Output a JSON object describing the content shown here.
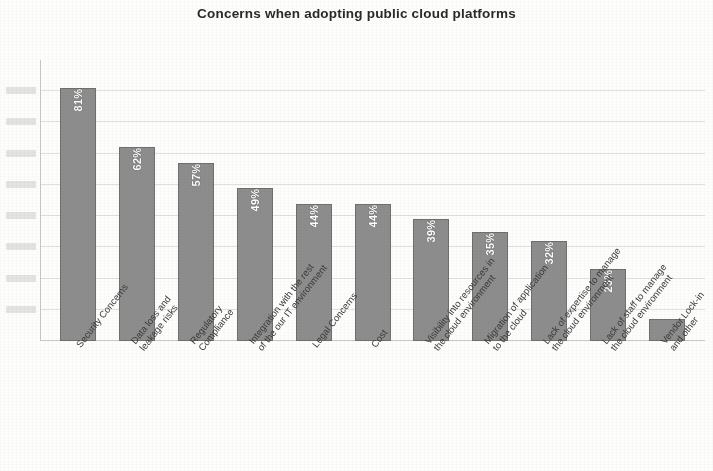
{
  "chart_data": {
    "type": "bar",
    "title": "Concerns when adopting public cloud platforms",
    "xlabel": "",
    "ylabel": "",
    "ylim": [
      0,
      90
    ],
    "grid": true,
    "legend": "none",
    "orientation": "vertical",
    "bar_color": "#8d8d8d",
    "bar_border_color": "#6f6f6f",
    "value_label_color": "#ffffff",
    "value_label_rotation": -90,
    "category_label_rotation": -52,
    "gridline_values": [
      10,
      20,
      30,
      40,
      50,
      60,
      70,
      80
    ],
    "categories": [
      "Security Concerns",
      "Data loss and leakage risks",
      "Regulatory Compliance",
      "Integration with the rest of the our IT environment",
      "Legal Concerns",
      "Cost",
      "Visibility into resources in the cloud environment",
      "Migration of application to the cloud",
      "Lack of expertise to manage the cloud environment",
      "Lack of staff to manage the cloud environment",
      "Vendor Lock-in and other"
    ],
    "category_lines": [
      [
        "Security Concerns"
      ],
      [
        "Data loss and",
        "leakage risks"
      ],
      [
        "Regulatory",
        "Compliance"
      ],
      [
        "Integration with the rest",
        "of the our IT environment"
      ],
      [
        "Legal Concerns"
      ],
      [
        "Cost"
      ],
      [
        "Visibility into resources in",
        "the cloud environment"
      ],
      [
        "Migration of application",
        "to the cloud"
      ],
      [
        "Lack of expertise to manage",
        "the cloud environment"
      ],
      [
        "Lack of staff to manage",
        "the cloud environment"
      ],
      [
        "Vendor Lock-in",
        "and other"
      ]
    ],
    "values": [
      81,
      62,
      57,
      49,
      44,
      44,
      39,
      35,
      32,
      23,
      7
    ],
    "value_labels": [
      "81%",
      "62%",
      "57%",
      "49%",
      "44%",
      "44%",
      "39%",
      "35%",
      "32%",
      "23%",
      ""
    ]
  }
}
